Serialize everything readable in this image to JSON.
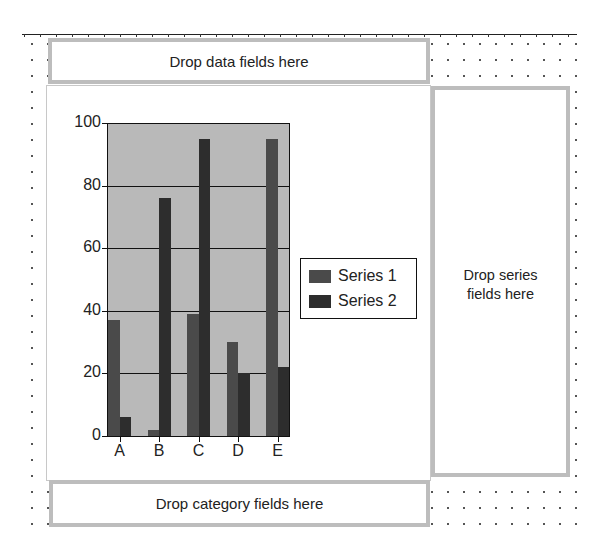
{
  "drop_zones": {
    "data": "Drop data fields here",
    "series": "Drop series fields here",
    "category": "Drop category fields here"
  },
  "colors": {
    "plot_background": "#b9b9b9",
    "series1": "#4a4a4a",
    "series2": "#2d2d2d",
    "gridline": "#111111",
    "drop_zone_border": "#bdbdbd"
  },
  "chart_data": {
    "type": "bar",
    "title": "",
    "xlabel": "",
    "ylabel": "",
    "categories": [
      "A",
      "B",
      "C",
      "D",
      "E"
    ],
    "series": [
      {
        "name": "Series 1",
        "values": [
          37,
          2,
          39,
          30,
          95
        ]
      },
      {
        "name": "Series 2",
        "values": [
          6,
          76,
          95,
          20,
          22
        ]
      }
    ],
    "ylim": [
      0,
      100
    ],
    "yticks": [
      0,
      20,
      40,
      60,
      80,
      100
    ],
    "grid": true,
    "legend_position": "right"
  }
}
